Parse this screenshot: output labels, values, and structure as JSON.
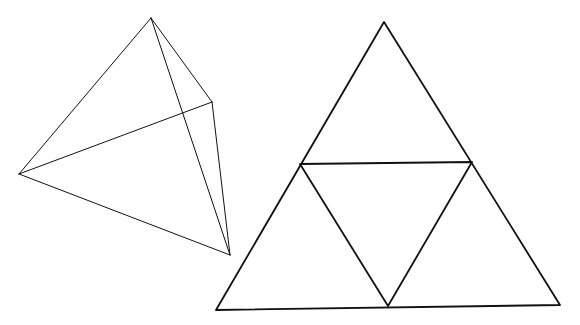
{
  "figure": {
    "width": 580,
    "height": 325,
    "background": "#ffffff",
    "stroke": "#111111",
    "tetrahedron": {
      "vertices": {
        "top": [
          151,
          18
        ],
        "right": [
          212,
          102
        ],
        "left": [
          19,
          174
        ],
        "bottom": [
          230,
          255
        ]
      },
      "edges": [
        [
          "top",
          "left"
        ],
        [
          "top",
          "right"
        ],
        [
          "top",
          "bottom"
        ],
        [
          "right",
          "left"
        ],
        [
          "right",
          "bottom"
        ],
        [
          "left",
          "bottom"
        ]
      ],
      "stroke_width": 1
    },
    "net": {
      "outer": {
        "top": [
          384,
          22
        ],
        "bottom_left": [
          216,
          310
        ],
        "bottom_right": [
          560,
          305
        ]
      },
      "midpoints": {
        "left": [
          300,
          164
        ],
        "right": [
          472,
          162
        ],
        "bottom": [
          388,
          306
        ]
      },
      "stroke_width": 1.8
    }
  }
}
